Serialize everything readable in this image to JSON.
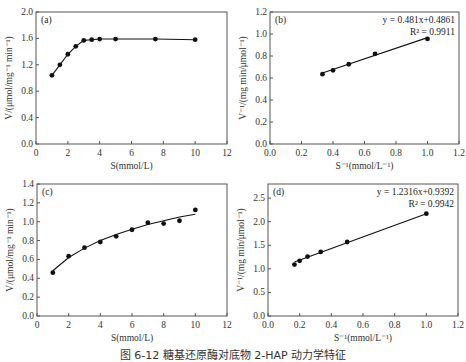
{
  "caption": "图 6-12   糖基还原酶对底物 2-HAP 动力学特征",
  "chart_data": [
    {
      "panel": "(a)",
      "type": "line",
      "xlabel": "S(mmol/L)",
      "ylabel": "V/(μmol/mg⁻¹ min⁻¹)",
      "xlim": [
        0,
        12
      ],
      "ylim": [
        0,
        2.0
      ],
      "xticks": [
        "0",
        "2",
        "4",
        "6",
        "8",
        "10",
        "12"
      ],
      "yticks": [
        "0.0",
        "0.4",
        "0.8",
        "1.2",
        "1.6",
        "2.0"
      ],
      "series": [
        {
          "name": "data",
          "x": [
            1,
            1.5,
            2,
            2.5,
            3,
            3.5,
            4,
            5,
            7.5,
            10
          ],
          "y": [
            1.04,
            1.2,
            1.36,
            1.48,
            1.57,
            1.58,
            1.59,
            1.59,
            1.59,
            1.58
          ]
        }
      ],
      "annotations": []
    },
    {
      "panel": "(b)",
      "type": "scatter",
      "xlabel": "S⁻¹(mmol/L⁻¹)",
      "ylabel": "V⁻¹/(mg  min/μmol⁻¹)",
      "xlim": [
        0,
        1.2
      ],
      "ylim": [
        0,
        1.2
      ],
      "xticks": [
        "0.0",
        "0.2",
        "0.4",
        "0.6",
        "0.8",
        "1.0",
        "1.2"
      ],
      "yticks": [
        "0.0",
        "0.2",
        "0.4",
        "0.6",
        "0.8",
        "1.0",
        "1.2"
      ],
      "series": [
        {
          "name": "data",
          "x": [
            0.333,
            0.4,
            0.5,
            0.667,
            1.0
          ],
          "y": [
            0.635,
            0.67,
            0.725,
            0.82,
            0.955
          ]
        }
      ],
      "fit": {
        "slope": 0.481,
        "intercept": 0.4861,
        "x_range": [
          0.333,
          1.0
        ]
      },
      "annotations": [
        "y = 0.481x+0.4861",
        "R² = 0.9911"
      ]
    },
    {
      "panel": "(c)",
      "type": "scatter",
      "xlabel": "S(mmol/L)",
      "ylabel": "V/(μmol/mg⁻¹ min⁻¹)",
      "xlim": [
        0,
        12
      ],
      "ylim": [
        0,
        1.4
      ],
      "xticks": [
        "0",
        "2",
        "4",
        "6",
        "8",
        "10",
        "12"
      ],
      "yticks": [
        "0.0",
        "0.2",
        "0.4",
        "0.6",
        "0.8",
        "1.0",
        "1.2",
        "1.4"
      ],
      "series": [
        {
          "name": "data",
          "x": [
            1,
            2,
            3,
            4,
            5,
            6,
            7,
            8,
            9,
            10
          ],
          "y": [
            0.46,
            0.635,
            0.725,
            0.785,
            0.845,
            0.915,
            0.99,
            0.98,
            1.01,
            1.125
          ]
        }
      ],
      "fit_curve": {
        "x": [
          1,
          2,
          3,
          4,
          5,
          6,
          7,
          8,
          9,
          10
        ],
        "y": [
          0.48,
          0.62,
          0.72,
          0.8,
          0.865,
          0.92,
          0.97,
          1.01,
          1.05,
          1.08
        ]
      },
      "annotations": []
    },
    {
      "panel": "(d)",
      "type": "scatter",
      "xlabel": "S⁻¹(mmol/L⁻¹)",
      "ylabel": "V⁻¹/(mg  min/μmol⁻¹)",
      "xlim": [
        0,
        1.2
      ],
      "ylim": [
        0,
        2.8
      ],
      "xticks": [
        "0.0",
        "0.2",
        "0.4",
        "0.6",
        "0.8",
        "1.0",
        "1.2"
      ],
      "yticks": [
        "0.0",
        "0.5",
        "1.0",
        "1.5",
        "2.0",
        "2.5"
      ],
      "series": [
        {
          "name": "data",
          "x": [
            0.167,
            0.2,
            0.25,
            0.333,
            0.5,
            1.0
          ],
          "y": [
            1.09,
            1.17,
            1.26,
            1.36,
            1.57,
            2.17
          ]
        }
      ],
      "fit": {
        "slope": 1.2316,
        "intercept": 0.9392,
        "x_range": [
          0.167,
          1.0
        ]
      },
      "annotations": [
        "y = 1.2316x+0.9392",
        "R² = 0.9942"
      ]
    }
  ]
}
